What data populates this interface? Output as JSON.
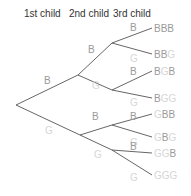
{
  "headers": [
    "1st child",
    "2nd child",
    "3rd child"
  ],
  "colors": {
    "boy": "#9a9a9a",
    "girl": "#d6d6d6",
    "edge": "#555555"
  },
  "tree": {
    "root": {
      "x": 16,
      "y": 105
    },
    "level1": [
      {
        "label": "B",
        "x": 78,
        "y": 75,
        "lx": 44,
        "ly": 84
      },
      {
        "label": "G",
        "x": 80,
        "y": 135,
        "lx": 45,
        "ly": 134
      }
    ],
    "level2": [
      {
        "label": "B",
        "x": 112,
        "y": 43,
        "lx": 88,
        "ly": 53,
        "parent": 0
      },
      {
        "label": "G",
        "x": 112,
        "y": 90,
        "lx": 92,
        "ly": 89,
        "parent": 0
      },
      {
        "label": "B",
        "x": 112,
        "y": 125,
        "lx": 92,
        "ly": 120,
        "parent": 1
      },
      {
        "label": "G",
        "x": 112,
        "y": 150,
        "lx": 94,
        "ly": 158,
        "parent": 1
      }
    ],
    "level3": [
      {
        "label": "B",
        "lx": 130,
        "ly": 31,
        "x": 152,
        "y": 28,
        "parent": 0
      },
      {
        "label": "G",
        "lx": 130,
        "ly": 62,
        "x": 152,
        "y": 54,
        "parent": 0
      },
      {
        "label": "B",
        "lx": 130,
        "ly": 75,
        "x": 152,
        "y": 71,
        "parent": 1
      },
      {
        "label": "G",
        "lx": 130,
        "ly": 106,
        "x": 152,
        "y": 98,
        "parent": 1
      },
      {
        "label": "B",
        "lx": 130,
        "ly": 120,
        "x": 152,
        "y": 114,
        "parent": 2
      },
      {
        "label": "G",
        "lx": 130,
        "ly": 146,
        "x": 152,
        "y": 137,
        "parent": 2
      },
      {
        "label": "B",
        "lx": 130,
        "ly": 150,
        "x": 152,
        "y": 153,
        "parent": 3
      },
      {
        "label": "G",
        "lx": 130,
        "ly": 181,
        "x": 152,
        "y": 175,
        "parent": 3
      }
    ],
    "outcomes": [
      "BBB",
      "BBG",
      "BGB",
      "BGG",
      "GBB",
      "GBG",
      "GGB",
      "GGG"
    ]
  }
}
